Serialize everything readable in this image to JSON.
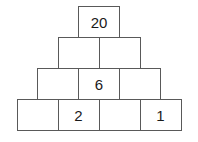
{
  "puzzle": {
    "type": "number-pyramid",
    "title": "Number Pyramid",
    "colors": {
      "border": "#595959",
      "cell_background": "#ffffff",
      "text": "#1a1a1a",
      "page_background": "#ffffff"
    },
    "rows": [
      {
        "index": 0,
        "cells": [
          {
            "value": "20",
            "filled": true
          }
        ]
      },
      {
        "index": 1,
        "cells": [
          {
            "value": "",
            "filled": false
          },
          {
            "value": "",
            "filled": false
          }
        ]
      },
      {
        "index": 2,
        "cells": [
          {
            "value": "",
            "filled": false
          },
          {
            "value": "6",
            "filled": true
          },
          {
            "value": "",
            "filled": false
          }
        ]
      },
      {
        "index": 3,
        "cells": [
          {
            "value": "",
            "filled": false
          },
          {
            "value": "2",
            "filled": true
          },
          {
            "value": "",
            "filled": false
          },
          {
            "value": "1",
            "filled": true
          }
        ]
      }
    ]
  }
}
